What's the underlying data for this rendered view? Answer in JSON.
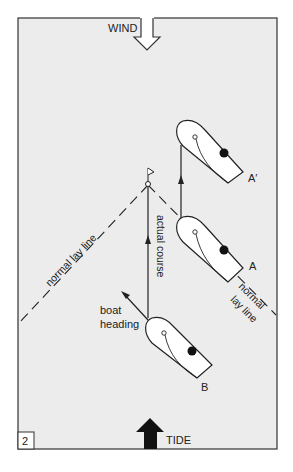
{
  "figure": {
    "number": "2",
    "background": "#ececec",
    "border_color": "#333333"
  },
  "labels": {
    "wind": "WIND",
    "tide": "TIDE",
    "normal_lay_line_left": "normal lay line",
    "normal_lay_line_right_1": "normal",
    "normal_lay_line_right_2": "lay line",
    "actual_course": "actual course",
    "boat_heading_1": "boat",
    "boat_heading_2": "heading",
    "boat_a": "A",
    "boat_a_prime": "A′",
    "boat_b": "B"
  },
  "elements": {
    "mark": "windward-mark-flag",
    "boats": [
      "A",
      "A'",
      "B"
    ],
    "wind_arrow": "hollow arrow pointing down",
    "tide_arrow": "solid arrow pointing up"
  }
}
